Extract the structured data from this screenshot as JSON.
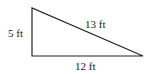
{
  "diagram": {
    "shape": "right-triangle",
    "vertices": {
      "top": [
        32,
        8
      ],
      "right_angle": [
        32,
        56
      ],
      "right": [
        143,
        56
      ]
    },
    "labels": {
      "vertical_leg": "5 ft",
      "hypotenuse": "13 ft",
      "horizontal_leg": "12 ft"
    },
    "stroke_color": "#222222"
  }
}
